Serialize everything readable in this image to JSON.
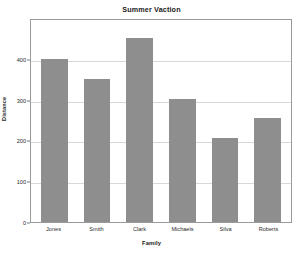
{
  "chart_data": {
    "type": "bar",
    "title": "Summer Vaction",
    "xlabel": "Family",
    "ylabel": "Distance",
    "categories": [
      "Jones",
      "Smith",
      "Clark",
      "Michaels",
      "Silva",
      "Roberts"
    ],
    "values": [
      400,
      350,
      450,
      302,
      205,
      255
    ],
    "ylim": [
      0,
      500
    ],
    "yticks": [
      0,
      100,
      200,
      300,
      400
    ],
    "ytick_labels": [
      "0",
      "100",
      "200",
      "300",
      "400"
    ],
    "grid": true,
    "grid_axis": "y",
    "legend": null,
    "bar_color": "#8e8e8e",
    "background_color": "#ffffff",
    "axis_color": "#9a9a9a",
    "gridline_color": "#d8d8d8"
  }
}
